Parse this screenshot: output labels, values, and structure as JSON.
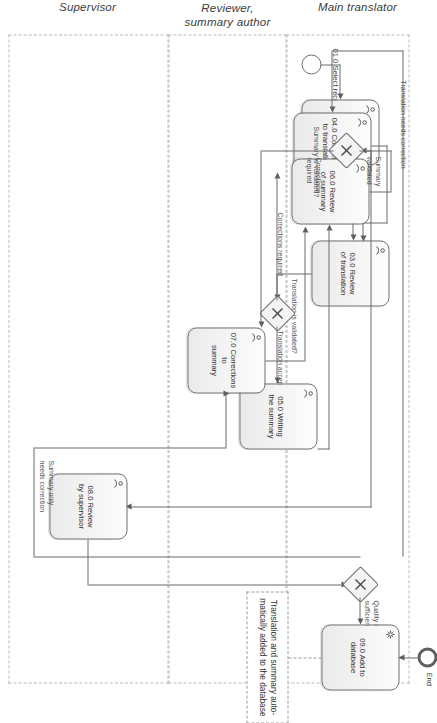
{
  "diagram": {
    "orientation": "rotated-90",
    "lanes": [
      {
        "id": "main-translator",
        "label": "Main translator"
      },
      {
        "id": "reviewer-summary-author",
        "label": "Reviewer,\nsummary author"
      },
      {
        "id": "supervisor",
        "label": "Supervisor"
      }
    ],
    "events": [
      {
        "id": "start",
        "type": "start",
        "label": "01.0 Select record"
      },
      {
        "id": "end",
        "type": "end",
        "label": "End"
      }
    ],
    "tasks": [
      {
        "id": "t02",
        "label": "02.0 Initial\ntranslation",
        "icon": "user-task-icon",
        "lane": "main-translator"
      },
      {
        "id": "t03",
        "label": "03.0 Review\nof translation",
        "icon": "user-task-icon",
        "lane": "reviewer-summary-author"
      },
      {
        "id": "t04",
        "label": "04.0 Corrections\nto translation",
        "icon": "user-task-icon",
        "lane": "main-translator"
      },
      {
        "id": "t05",
        "label": "05.0 Writing\nthe summary",
        "icon": "user-task-icon",
        "lane": "reviewer-summary-author"
      },
      {
        "id": "t06",
        "label": "06.0 Review\nof summary",
        "icon": "user-task-icon",
        "lane": "main-translator"
      },
      {
        "id": "t07",
        "label": "07.0 Corrections to\nsummary",
        "icon": "user-task-icon",
        "lane": "reviewer-summary-author"
      },
      {
        "id": "t08",
        "label": "08.0 Review\nby supervisor",
        "icon": "user-task-icon",
        "lane": "supervisor"
      },
      {
        "id": "t09",
        "label": "09.0 Add to\ndatabase",
        "icon": "service-task-icon",
        "lane": "supervisor"
      }
    ],
    "gateways": [
      {
        "id": "gw1",
        "type": "exclusive",
        "label": "Translation is validated?"
      },
      {
        "id": "gw2",
        "type": "exclusive",
        "label": "Summary is validated?"
      },
      {
        "id": "gw3",
        "type": "exclusive",
        "label": "Quality is\nsufficient"
      }
    ],
    "flow_labels": [
      {
        "id": "fl-corrections-required-1",
        "text": "Corrections required"
      },
      {
        "id": "fl-translation-accepted",
        "text": "Translation accepted"
      },
      {
        "id": "fl-translation-validated",
        "text": "Translation is validated?"
      },
      {
        "id": "fl-summary-validated",
        "text": "Summary\nvalidated"
      },
      {
        "id": "fl-corrections-required-2",
        "text": "Corrections\nrequired"
      },
      {
        "id": "fl-summary-is-validated",
        "text": "Summary is validated?"
      },
      {
        "id": "fl-translation-needs-correction",
        "text": "Translation needs correction"
      },
      {
        "id": "fl-summary-only-needs-correction",
        "text": "Summary only\nneeds correction"
      },
      {
        "id": "fl-quality-is-sufficient",
        "text": "Quality is\nsufficient"
      }
    ],
    "annotations": [
      {
        "id": "anno-db",
        "text": "Translation and summary auto-\nmatically added to the database"
      }
    ],
    "colors": {
      "task_border": "#6f6f6f",
      "task_fill_top": "#fdfdfd",
      "task_fill_bottom": "#eaeaea",
      "flow": "#6a6a6a",
      "lane_border": "#b9b9b9",
      "text": "#2f2f2f"
    }
  }
}
